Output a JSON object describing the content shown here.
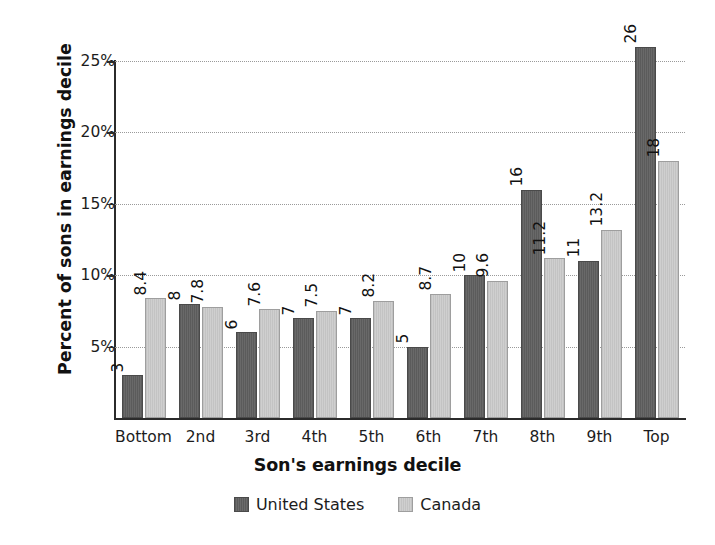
{
  "chart_data": {
    "type": "bar",
    "title": "",
    "subtitle": "",
    "xlabel": "Son's earnings decile",
    "ylabel": "Percent of sons in earnings decile",
    "categories": [
      "Bottom",
      "2nd",
      "3rd",
      "4th",
      "5th",
      "6th",
      "7th",
      "8th",
      "9th",
      "Top"
    ],
    "series": [
      {
        "name": "United States",
        "color": "#5f5f5f",
        "values": [
          3,
          8,
          6,
          7,
          7,
          5,
          10,
          16,
          11,
          26
        ],
        "labels": [
          "3",
          "8",
          "6",
          "7",
          "7",
          "5",
          "10",
          "16",
          "11",
          "26"
        ]
      },
      {
        "name": "Canada",
        "color": "#c8c8c8",
        "values": [
          8.4,
          7.8,
          7.6,
          7.5,
          8.2,
          8.7,
          9.6,
          11.2,
          13.2,
          18
        ],
        "labels": [
          "8.4",
          "7.8",
          "7.6",
          "7.5",
          "8.2",
          "8.7",
          "9.6",
          "11.2",
          "13.2",
          "18"
        ]
      }
    ],
    "ylim": [
      0,
      26.5
    ],
    "yticks": [
      5,
      10,
      15,
      20,
      25
    ],
    "ytick_labels": [
      "5%",
      "10%",
      "15%",
      "20%",
      "25%"
    ],
    "grid": true,
    "grid_style": "dotted",
    "legend_position": "bottom-center",
    "bar_label_orientation": "vertical"
  },
  "legend": {
    "items": [
      {
        "label": "United States",
        "swatch": "dark-gray-swatch"
      },
      {
        "label": "Canada",
        "swatch": "light-gray-swatch"
      }
    ]
  },
  "colors": {
    "united_states": "#5f5f5f",
    "canada": "#c8c8c8",
    "axis": "#2b2b2b",
    "gridline": "#9a9a9a",
    "text": "#111111",
    "background": "#ffffff"
  }
}
